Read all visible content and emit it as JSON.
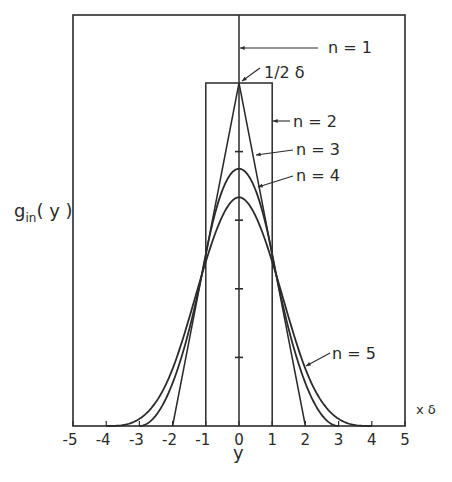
{
  "chart_data": {
    "type": "line",
    "title": "",
    "xlabel": "y",
    "ylabel": "g_in(y)",
    "x_unit_label": "x δ",
    "xlim": [
      -5,
      5
    ],
    "ylim": [
      0,
      0.6
    ],
    "xticks": [
      "-5",
      "-4",
      "-3",
      "-2",
      "-1",
      "0",
      "1",
      "2",
      "3",
      "4",
      "5"
    ],
    "y_minor_ticks_on_center_line": [
      0.1,
      0.2,
      0.3,
      0.4
    ],
    "grid": false,
    "legend": "inline annotations with arrows",
    "annotations": [
      {
        "text": "n=1",
        "points_to": "delta spike at y=0"
      },
      {
        "text": "1/2 δ",
        "points_to": "peak of n=2 at y=0, height 0.5"
      },
      {
        "text": "n=2",
        "points_to": "rectangle from -1 to 1"
      },
      {
        "text": "n=3",
        "points_to": "triangle from -2 to 2"
      },
      {
        "text": "n=4",
        "points_to": "curve peaking at 0.375"
      },
      {
        "text": "n=5",
        "points_to": "curve peaking at 0.333"
      }
    ],
    "series": [
      {
        "name": "n=1",
        "shape": "vertical spike",
        "x": [
          0,
          0
        ],
        "y": [
          0,
          0.6
        ]
      },
      {
        "name": "n=2",
        "shape": "rectangle",
        "x": [
          -1,
          -1,
          1,
          1
        ],
        "y": [
          0,
          0.5,
          0.5,
          0
        ]
      },
      {
        "name": "n=3",
        "shape": "triangle",
        "x": [
          -2,
          0,
          2
        ],
        "y": [
          0,
          0.5,
          0
        ]
      },
      {
        "name": "n=4",
        "shape": "quadratic spline (3-fold box convolution)",
        "x": [
          -3,
          -2,
          -1,
          0,
          1,
          2,
          3
        ],
        "y": [
          0,
          0.0625,
          0.25,
          0.375,
          0.25,
          0.0625,
          0
        ]
      },
      {
        "name": "n=5",
        "shape": "cubic spline (4-fold box convolution)",
        "x": [
          -4,
          -3,
          -2,
          -1,
          0,
          1,
          2,
          3,
          4
        ],
        "y": [
          0,
          0.0104,
          0.0833,
          0.2396,
          0.3333,
          0.2396,
          0.0833,
          0.0104,
          0
        ]
      }
    ]
  },
  "labels": {
    "n1": "n = 1",
    "peak": "1/2 δ",
    "n2": "n = 2",
    "n3": "n = 3",
    "n4": "n = 4",
    "n5": "n = 5",
    "ylabel_main": "g",
    "ylabel_sub": "in",
    "ylabel_arg": "( y )",
    "xlabel": "y",
    "xunit": "x δ"
  }
}
